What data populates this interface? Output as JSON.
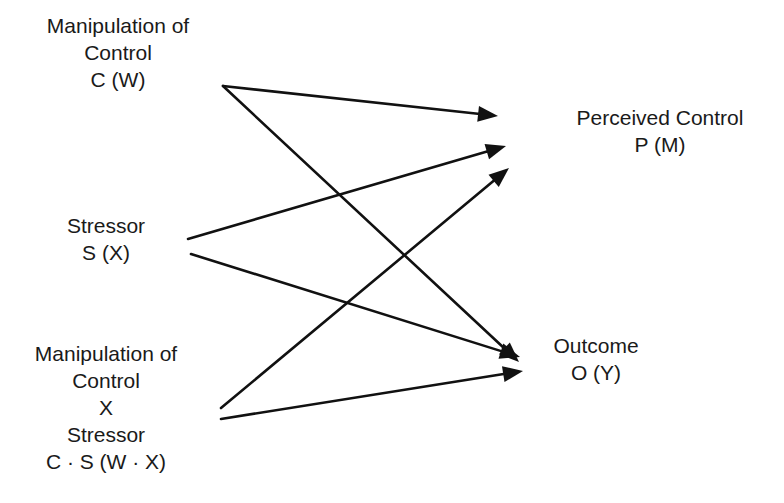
{
  "diagram": {
    "type": "path-model",
    "nodes": [
      {
        "id": "C",
        "lines": [
          "Manipulation of",
          "Control",
          "C (W)"
        ],
        "x": 118,
        "y": 12
      },
      {
        "id": "S",
        "lines": [
          "Stressor",
          "S (X)"
        ],
        "x": 106,
        "y": 212
      },
      {
        "id": "CS",
        "lines": [
          "Manipulation of",
          "Control",
          "X",
          "Stressor",
          "C · S (W · X)"
        ],
        "x": 106,
        "y": 340
      },
      {
        "id": "P",
        "lines": [
          "Perceived Control",
          "P (M)"
        ],
        "x": 660,
        "y": 104
      },
      {
        "id": "O",
        "lines": [
          "Outcome",
          "O (Y)"
        ],
        "x": 596,
        "y": 332
      }
    ],
    "edges": [
      {
        "from": "C",
        "to": "P",
        "x1": 223,
        "y1": 86,
        "x2": 498,
        "y2": 116
      },
      {
        "from": "C",
        "to": "O",
        "x1": 223,
        "y1": 86,
        "x2": 519,
        "y2": 362
      },
      {
        "from": "S",
        "to": "P",
        "x1": 188,
        "y1": 239,
        "x2": 506,
        "y2": 146
      },
      {
        "from": "S",
        "to": "O",
        "x1": 191,
        "y1": 254,
        "x2": 520,
        "y2": 357
      },
      {
        "from": "CS",
        "to": "P",
        "x1": 221,
        "y1": 408,
        "x2": 509,
        "y2": 168
      },
      {
        "from": "CS",
        "to": "O",
        "x1": 221,
        "y1": 419,
        "x2": 523,
        "y2": 371
      }
    ],
    "colors": {
      "line": "#111111",
      "text": "#1a1a1a",
      "background": "#ffffff"
    }
  }
}
